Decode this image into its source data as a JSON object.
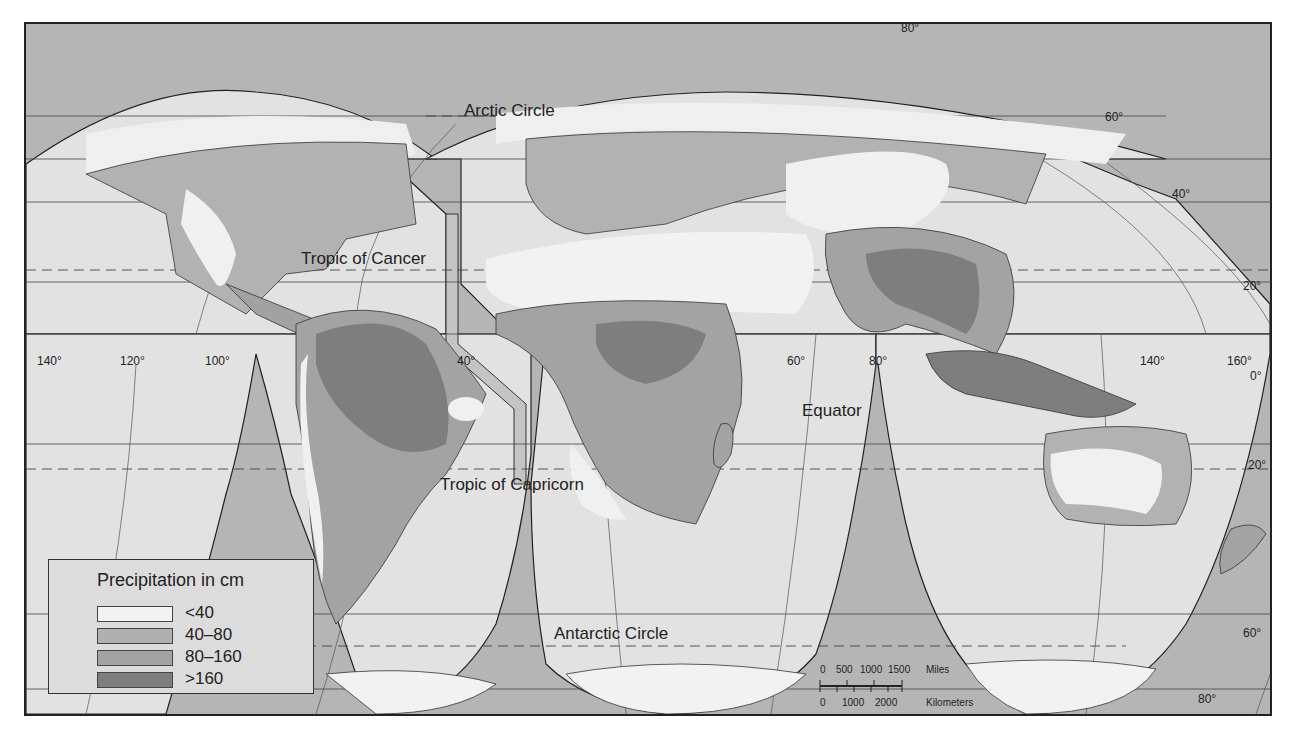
{
  "map": {
    "title": "Precipitation in cm",
    "projection": "interrupted world map",
    "colors": {
      "frame_background": "#b5b5b5",
      "lobe_fill": "#e2e2e2",
      "lt40": "#f0f0f0",
      "p40_80": "#b0b0b0",
      "p80_160": "#a0a0a0",
      "gt160": "#7e7e7e",
      "lines": "#333333"
    },
    "labels": {
      "arctic_circle": "Arctic Circle",
      "tropic_of_cancer": "Tropic of Cancer",
      "tropic_of_capricorn": "Tropic of Capricorn",
      "equator": "Equator",
      "antarctic_circle": "Antarctic Circle"
    },
    "degree_labels": {
      "lon_140w": "140°",
      "lon_120w": "120°",
      "lon_100w": "100°",
      "lon_40w": "40°",
      "lon_60e": "60°",
      "lon_80e": "80°",
      "lon_140e": "140°",
      "lon_160e": "160°",
      "lat_80n": "80°",
      "lat_60n": "60°",
      "lat_40n": "40°",
      "lat_20n": "20°",
      "lat_0": "0°",
      "lat_20s": "20°",
      "lat_60s": "60°",
      "lat_80s": "80°"
    }
  },
  "legend": {
    "title": "Precipitation in cm",
    "items": [
      {
        "label": "<40",
        "color": "#f0f0f0"
      },
      {
        "label": "40–80",
        "color": "#b0b0b0"
      },
      {
        "label": "80–160",
        "color": "#a3a3a3"
      },
      {
        "label": ">160",
        "color": "#7e7e7e"
      }
    ]
  },
  "scale_bar": {
    "miles_ticks": [
      "0",
      "500",
      "1000",
      "1500"
    ],
    "miles_unit": "Miles",
    "km_ticks": [
      "0",
      "1000",
      "2000"
    ],
    "km_unit": "Kilometers"
  }
}
